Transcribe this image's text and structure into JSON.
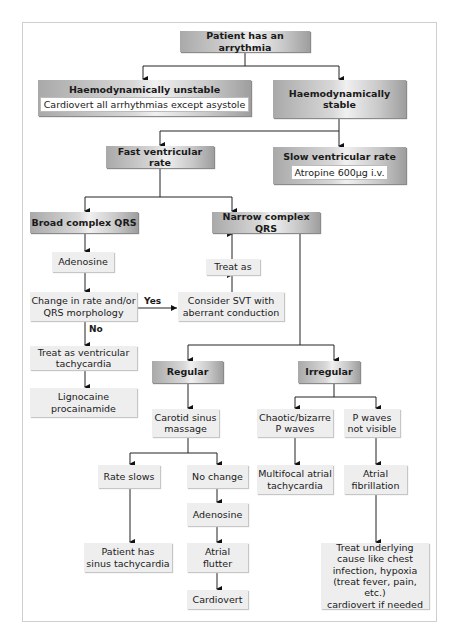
{
  "flowchart": {
    "root": "Patient has an arrythmia",
    "unstable": {
      "title": "Haemodynamically unstable",
      "action": "Cardiovert all arrhythmias except asystole"
    },
    "stable": {
      "title": "Haemodynamically stable"
    },
    "fast": "Fast ventricular rate",
    "slow": {
      "title": "Slow ventricular rate",
      "action": "Atropine 600µg i.v."
    },
    "broad": "Broad complex QRS",
    "narrow": "Narrow complex QRS",
    "adenosine_broad": "Adenosine",
    "change": [
      "Change in rate and/or",
      "QRS morphology"
    ],
    "yes_label": "Yes",
    "no_label": "No",
    "consider_svt": [
      "Consider SVT with",
      "aberrant conduction"
    ],
    "treat_as": "Treat as",
    "treat_vt": [
      "Treat as ventricular",
      "tachycardia"
    ],
    "lignocaine": [
      "Lignocaine",
      "procainamide"
    ],
    "regular": "Regular",
    "irregular": "Irregular",
    "carotid": [
      "Carotid sinus",
      "massage"
    ],
    "chaotic": [
      "Chaotic/bizarre",
      "P waves"
    ],
    "p_not_visible": [
      "P waves",
      "not visible"
    ],
    "rate_slows": "Rate slows",
    "no_change": "No change",
    "multifocal": [
      "Multifocal atrial",
      "tachycardia"
    ],
    "atrial_fib": [
      "Atrial",
      "fibrillation"
    ],
    "adenosine_regular": "Adenosine",
    "sinus_tachy": [
      "Patient has",
      "sinus tachycardia"
    ],
    "atrial_flutter": [
      "Atrial",
      "flutter"
    ],
    "cardiovert": "Cardiovert",
    "treat_underlying": [
      "Treat underlying",
      "cause like chest",
      "infection, hypoxia",
      "(treat fever, pain, etc.)",
      "cardiovert if needed"
    ]
  },
  "colors": {
    "header_dark": "#a9a9a9",
    "header_light": "#f0f0f0",
    "box_light": "#eeeeee",
    "line": "#222222",
    "frame": "#cfcfcf"
  }
}
